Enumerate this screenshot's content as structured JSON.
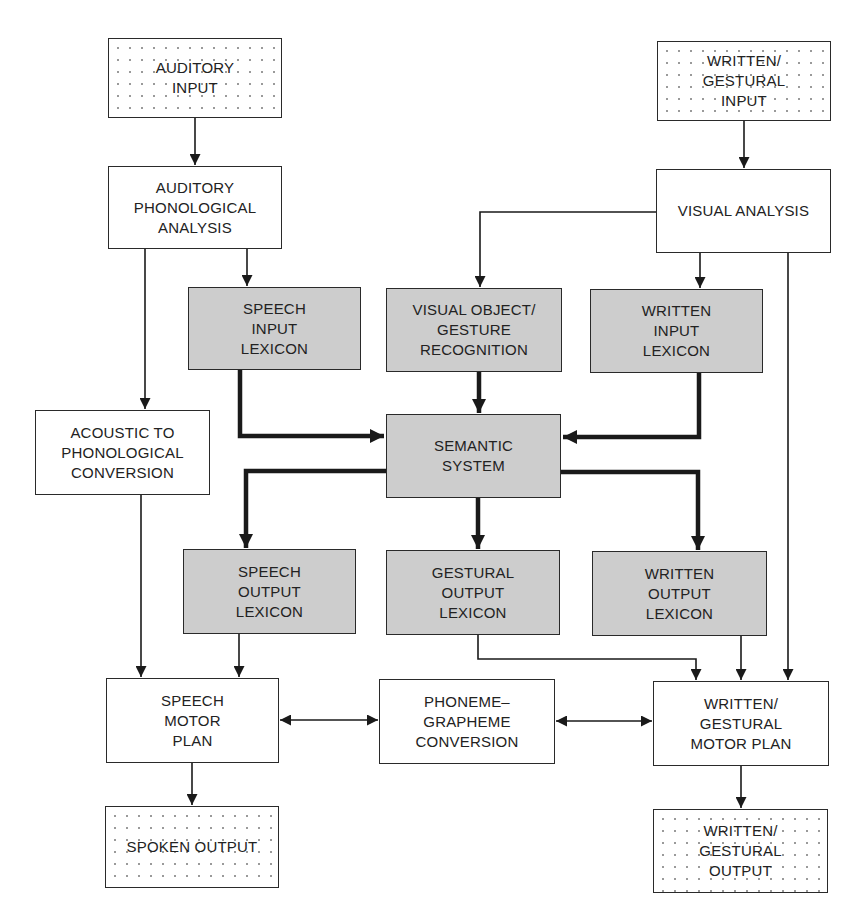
{
  "diagram": {
    "type": "cognitive-neuropsychological language processing model",
    "colors": {
      "line": "#1a1a1a",
      "module_fill": "#cdcdcd",
      "box_fill": "#ffffff",
      "border": "#2a2a2a"
    },
    "nodes": {
      "auditory_input": {
        "label": "AUDITORY\nINPUT",
        "style": "dotted"
      },
      "written_gestural_input": {
        "label": "WRITTEN/\nGESTURAL\nINPUT",
        "style": "dotted"
      },
      "auditory_phonological_analysis": {
        "label": "AUDITORY\nPHONOLOGICAL\nANALYSIS",
        "style": "white"
      },
      "visual_analysis": {
        "label": "VISUAL ANALYSIS",
        "style": "white"
      },
      "speech_input_lexicon": {
        "label": "SPEECH\nINPUT\nLEXICON",
        "style": "gray"
      },
      "visual_object_gesture_recognition": {
        "label": "VISUAL OBJECT/\nGESTURE\nRECOGNITION",
        "style": "gray"
      },
      "written_input_lexicon": {
        "label": "WRITTEN\nINPUT\nLEXICON",
        "style": "gray"
      },
      "acoustic_to_phonological_conversion": {
        "label": "ACOUSTIC TO\nPHONOLOGICAL\nCONVERSION",
        "style": "white"
      },
      "semantic_system": {
        "label": "SEMANTIC\nSYSTEM",
        "style": "gray"
      },
      "speech_output_lexicon": {
        "label": "SPEECH\nOUTPUT\nLEXICON",
        "style": "gray"
      },
      "gestural_output_lexicon": {
        "label": "GESTURAL\nOUTPUT\nLEXICON",
        "style": "gray"
      },
      "written_output_lexicon": {
        "label": "WRITTEN\nOUTPUT\nLEXICON",
        "style": "gray"
      },
      "speech_motor_plan": {
        "label": "SPEECH\nMOTOR\nPLAN",
        "style": "white"
      },
      "phoneme_grapheme_conversion": {
        "label": "PHONEME–\nGRAPHEME\nCONVERSION",
        "style": "white"
      },
      "written_gestural_motor_plan": {
        "label": "WRITTEN/\nGESTURAL\nMOTOR PLAN",
        "style": "white"
      },
      "spoken_output": {
        "label": "SPOKEN OUTPUT",
        "style": "dotted"
      },
      "written_gestural_output": {
        "label": "WRITTEN/\nGESTURAL\nOUTPUT",
        "style": "dotted"
      }
    },
    "edges": [
      {
        "from": "auditory_input",
        "to": "auditory_phonological_analysis",
        "weight": "thin"
      },
      {
        "from": "auditory_phonological_analysis",
        "to": "speech_input_lexicon",
        "weight": "thin"
      },
      {
        "from": "auditory_phonological_analysis",
        "to": "acoustic_to_phonological_conversion",
        "weight": "thin"
      },
      {
        "from": "written_gestural_input",
        "to": "visual_analysis",
        "weight": "thin"
      },
      {
        "from": "visual_analysis",
        "to": "visual_object_gesture_recognition",
        "weight": "thin"
      },
      {
        "from": "visual_analysis",
        "to": "written_input_lexicon",
        "weight": "thin"
      },
      {
        "from": "visual_analysis",
        "to": "written_gestural_motor_plan",
        "weight": "thin"
      },
      {
        "from": "speech_input_lexicon",
        "to": "semantic_system",
        "weight": "thick"
      },
      {
        "from": "visual_object_gesture_recognition",
        "to": "semantic_system",
        "weight": "thick"
      },
      {
        "from": "written_input_lexicon",
        "to": "semantic_system",
        "weight": "thick"
      },
      {
        "from": "semantic_system",
        "to": "speech_output_lexicon",
        "weight": "thick"
      },
      {
        "from": "semantic_system",
        "to": "gestural_output_lexicon",
        "weight": "thick"
      },
      {
        "from": "semantic_system",
        "to": "written_output_lexicon",
        "weight": "thick"
      },
      {
        "from": "acoustic_to_phonological_conversion",
        "to": "speech_motor_plan",
        "weight": "thin"
      },
      {
        "from": "speech_output_lexicon",
        "to": "speech_motor_plan",
        "weight": "thin"
      },
      {
        "from": "gestural_output_lexicon",
        "to": "written_gestural_motor_plan",
        "weight": "thin"
      },
      {
        "from": "written_output_lexicon",
        "to": "written_gestural_motor_plan",
        "weight": "thin"
      },
      {
        "from": "speech_motor_plan",
        "to": "phoneme_grapheme_conversion",
        "weight": "thin",
        "bidirectional": true
      },
      {
        "from": "phoneme_grapheme_conversion",
        "to": "written_gestural_motor_plan",
        "weight": "thin",
        "bidirectional": true
      },
      {
        "from": "speech_motor_plan",
        "to": "spoken_output",
        "weight": "thin"
      },
      {
        "from": "written_gestural_motor_plan",
        "to": "written_gestural_output",
        "weight": "thin"
      }
    ]
  }
}
